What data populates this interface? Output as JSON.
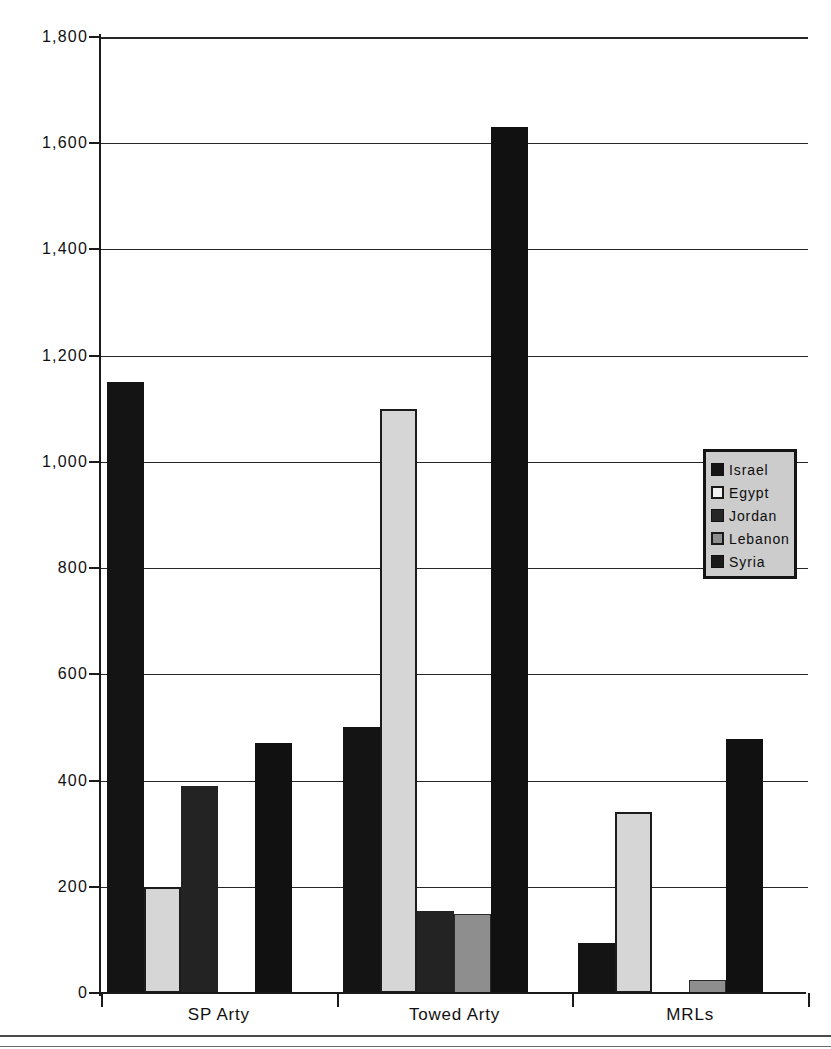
{
  "chart_data": {
    "type": "bar",
    "title": "",
    "xlabel": "",
    "ylabel": "",
    "categories": [
      "SP Arty",
      "Towed Arty",
      "MRLs"
    ],
    "series": [
      {
        "name": "Israel",
        "color": "#141414",
        "values": [
          1150,
          500,
          95
        ]
      },
      {
        "name": "Egypt",
        "color": "#d6d6d6",
        "values": [
          200,
          1100,
          340
        ]
      },
      {
        "name": "Jordan",
        "color": "#232323",
        "values": [
          390,
          155,
          0
        ]
      },
      {
        "name": "Lebanon",
        "color": "#8e8e8e",
        "values": [
          0,
          148,
          25
        ]
      },
      {
        "name": "Syria",
        "color": "#111111",
        "values": [
          470,
          1630,
          478
        ]
      }
    ],
    "ylim": [
      0,
      1800
    ],
    "ytick_values": [
      0,
      200,
      400,
      600,
      800,
      1000,
      1200,
      1400,
      1600,
      1800
    ],
    "ytick_labels": [
      "0",
      "200",
      "400",
      "600",
      "800",
      "1,000",
      "1,200",
      "1,400",
      "1,600",
      "1,800"
    ],
    "grid": true,
    "legend_position": "right-middle",
    "legend_entries": [
      "Israel",
      "Egypt",
      "Jordan",
      "Lebanon",
      "Syria"
    ]
  },
  "axis": {
    "y_labels": [
      "1,800",
      "1,600",
      "1,400",
      "1,200",
      "1,000",
      "800",
      "600",
      "400",
      "200",
      "0"
    ],
    "x_labels": [
      "SP Arty",
      "Towed Arty",
      "MRLs"
    ]
  },
  "legend": {
    "items": [
      {
        "label": "Israel"
      },
      {
        "label": "Egypt"
      },
      {
        "label": "Jordan"
      },
      {
        "label": "Lebanon"
      },
      {
        "label": "Syria"
      }
    ]
  }
}
